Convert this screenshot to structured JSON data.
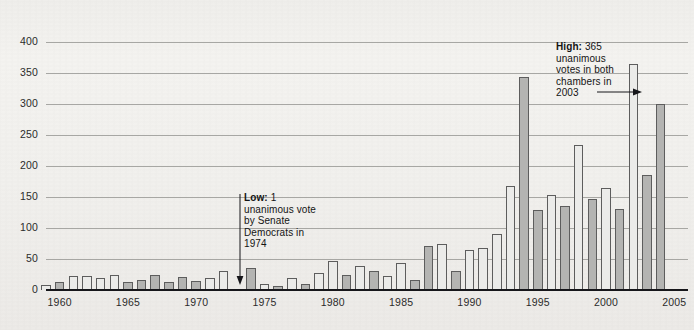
{
  "figure": {
    "background_color": "#f1f0ed",
    "bar_light_color": "#ebebe9",
    "bar_dark_color": "#b4b4b2",
    "bar_white_color": "#fbfbfa",
    "bar_border_color": "#5d5d5d",
    "gridline_color": "#9a9a96",
    "axis_color": "#16161a"
  },
  "annotations": {
    "low": {
      "label": "Low:",
      "value": "1",
      "line1": "unanimous vote",
      "line2": "by Senate",
      "line3": "Democrats in",
      "line4": "1974",
      "arrow": "arrow-down",
      "points_to_year": 1974
    },
    "high": {
      "label": "High:",
      "value": "365",
      "line1": "unanimous",
      "line2": "votes in both",
      "line3": "chambers in",
      "line4": "2003",
      "arrow": "arrow-right",
      "points_to_year": 2003
    }
  },
  "chart_data": {
    "type": "bar",
    "title": "",
    "subtitle": "",
    "xlabel": "",
    "ylabel": "",
    "ylim": [
      0,
      400
    ],
    "ytick_step": 50,
    "yticks": [
      0,
      50,
      100,
      150,
      200,
      250,
      300,
      350,
      400
    ],
    "ytick_labels": [
      "0",
      "50",
      "100",
      "150",
      "200",
      "250",
      "300",
      "350",
      "400"
    ],
    "xlim": [
      1959,
      2006
    ],
    "xticks": [
      1960,
      1965,
      1970,
      1975,
      1980,
      1985,
      1990,
      1995,
      2000,
      2005
    ],
    "xtick_labels": [
      "1960",
      "1965",
      "1970",
      "1975",
      "1980",
      "1985",
      "1990",
      "1995",
      "2000",
      "2005"
    ],
    "grid": true,
    "legend": "none",
    "categories": [
      1959,
      1960,
      1961,
      1962,
      1963,
      1964,
      1965,
      1966,
      1967,
      1968,
      1969,
      1970,
      1971,
      1972,
      1973,
      1974,
      1975,
      1976,
      1977,
      1978,
      1979,
      1980,
      1981,
      1982,
      1983,
      1984,
      1985,
      1986,
      1987,
      1988,
      1989,
      1990,
      1991,
      1992,
      1993,
      1994,
      1995,
      1996,
      1997,
      1998,
      1999,
      2000,
      2001,
      2002,
      2003,
      2004,
      2005
    ],
    "values": [
      8,
      13,
      22,
      23,
      20,
      24,
      13,
      16,
      25,
      13,
      21,
      14,
      20,
      31,
      1,
      36,
      9,
      6,
      19,
      9,
      28,
      46,
      24,
      38,
      31,
      22,
      44,
      16,
      71,
      75,
      31,
      64,
      68,
      91,
      167,
      343,
      129,
      154,
      135,
      234,
      146,
      164,
      130,
      365,
      185,
      300,
      0
    ],
    "bar_shades": [
      "light",
      "dark",
      "light",
      "light",
      "light",
      "light",
      "dark",
      "dark",
      "dark",
      "dark",
      "dark",
      "dark",
      "light",
      "light",
      "light",
      "dark",
      "light",
      "dark",
      "light",
      "dark",
      "light",
      "light",
      "dark",
      "light",
      "dark",
      "light",
      "light",
      "dark",
      "dark",
      "light",
      "dark",
      "light",
      "light",
      "light",
      "light",
      "dark",
      "dark",
      "light",
      "dark",
      "light",
      "dark",
      "light",
      "dark",
      "light",
      "dark",
      "dark",
      "white"
    ]
  }
}
